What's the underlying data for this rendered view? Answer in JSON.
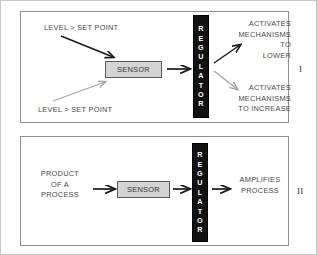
{
  "figure": {
    "colors": {
      "panel_border": "#8f8f8f",
      "outer_border": "#c9c9c9",
      "sensor_fill": "#d4d4d4",
      "sensor_border": "#5c5c5c",
      "regulator_fill": "#111111",
      "regulator_text": "#ffffff",
      "arrow_dark": "#1a1a1a",
      "arrow_light": "#a6a6a6",
      "label_text": "#4a4a4a"
    }
  },
  "panels": [
    {
      "id": "I",
      "roman_label": "I",
      "inputs": [
        {
          "text": "LEVEL > SET POINT",
          "arrow": "dark"
        },
        {
          "text": "LEVEL > SET POINT",
          "arrow": "light"
        }
      ],
      "sensor_label": "SENSOR",
      "regulator_label": "REGULATOR",
      "regulator_letters": [
        "R",
        "E",
        "G",
        "U",
        "L",
        "A",
        "T",
        "O",
        "R"
      ],
      "outputs": [
        {
          "text": "ACTIVATES\nMECHANISMS\nTO\nLOWER",
          "arrow": "dark"
        },
        {
          "text": "ACTIVATES\nMECHANISMS\nTO INCREASE",
          "arrow": "light"
        }
      ]
    },
    {
      "id": "II",
      "roman_label": "II",
      "inputs": [
        {
          "text": "PRODUCT\nOF A\nPROCESS",
          "arrow": "dark"
        }
      ],
      "sensor_label": "SENSOR",
      "regulator_label": "REGULATOR",
      "regulator_letters": [
        "R",
        "E",
        "G",
        "U",
        "L",
        "A",
        "T",
        "O",
        "R"
      ],
      "outputs": [
        {
          "text": "AMPLIFIES\nPROCESS",
          "arrow": "dark"
        }
      ]
    }
  ]
}
